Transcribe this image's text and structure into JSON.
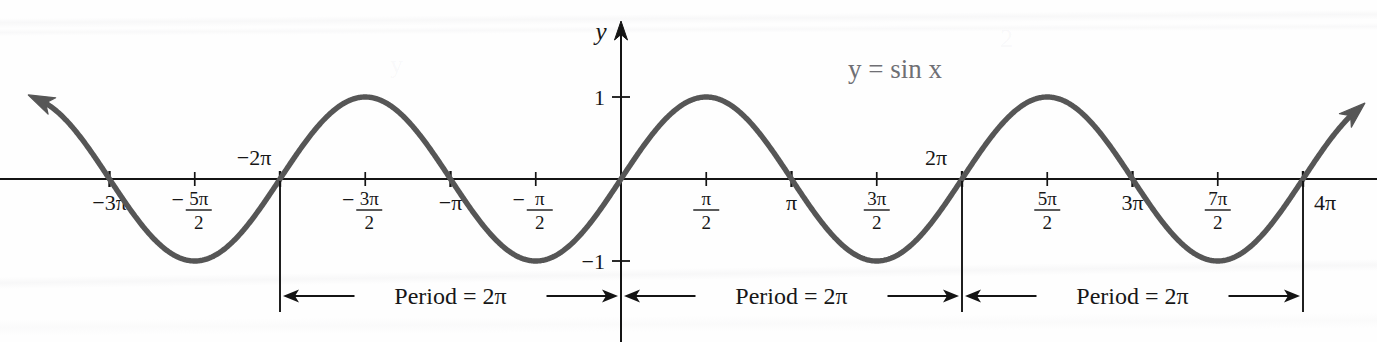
{
  "figure": {
    "curve_label": "y = sin x",
    "axis_labels": {
      "y": "y"
    },
    "colors": {
      "curve": "#565656",
      "axis": "#141414",
      "label": "#6f6f74",
      "background": "#fefefe"
    }
  },
  "chart_data": {
    "type": "line",
    "title": "y = sin x",
    "xlabel": "",
    "ylabel": "y",
    "xlim": [
      -3.4,
      4.3
    ],
    "ylim": [
      -1.35,
      1.35
    ],
    "grid": false,
    "legend": "none",
    "x_unit": "pi",
    "series": [
      {
        "name": "y = sin x",
        "expression": "sin(x)",
        "color": "#565656",
        "x_start_pi": -3.4,
        "x_end_pi": 4.3,
        "amplitude": 1,
        "period_pi": 2
      }
    ],
    "x_ticks": [
      {
        "value_pi": -3,
        "label": "−3π",
        "major": true,
        "type": "plain"
      },
      {
        "value_pi": -2.5,
        "label": "−5π/2",
        "major": false,
        "type": "fraction",
        "sign": "−",
        "num": "5π",
        "den": "2"
      },
      {
        "value_pi": -2,
        "label": "−2π",
        "major": true,
        "type": "plain"
      },
      {
        "value_pi": -1.5,
        "label": "−3π/2",
        "major": false,
        "type": "fraction",
        "sign": "−",
        "num": "3π",
        "den": "2"
      },
      {
        "value_pi": -1,
        "label": "−π",
        "major": true,
        "type": "plain"
      },
      {
        "value_pi": -0.5,
        "label": "−π/2",
        "major": false,
        "type": "fraction",
        "sign": "−",
        "num": "π",
        "den": "2"
      },
      {
        "value_pi": 0.5,
        "label": "π/2",
        "major": false,
        "type": "fraction",
        "sign": "",
        "num": "π",
        "den": "2"
      },
      {
        "value_pi": 1,
        "label": "π",
        "major": true,
        "type": "plain"
      },
      {
        "value_pi": 1.5,
        "label": "3π/2",
        "major": false,
        "type": "fraction",
        "sign": "",
        "num": "3π",
        "den": "2"
      },
      {
        "value_pi": 2,
        "label": "2π",
        "major": true,
        "type": "plain"
      },
      {
        "value_pi": 2.5,
        "label": "5π/2",
        "major": false,
        "type": "fraction",
        "sign": "",
        "num": "5π",
        "den": "2"
      },
      {
        "value_pi": 3,
        "label": "3π",
        "major": true,
        "type": "plain"
      },
      {
        "value_pi": 3.5,
        "label": "7π/2",
        "major": false,
        "type": "fraction",
        "sign": "",
        "num": "7π",
        "den": "2"
      },
      {
        "value_pi": 4,
        "label": "4π",
        "major": true,
        "type": "plain"
      }
    ],
    "y_ticks": [
      {
        "value": 1,
        "label": "1"
      },
      {
        "value": -1,
        "label": "−1"
      }
    ],
    "annotations": [
      {
        "name": "period-bracket-1",
        "text": "Period = 2π",
        "from_pi": -2,
        "to_pi": 0
      },
      {
        "name": "period-bracket-2",
        "text": "Period = 2π",
        "from_pi": 0,
        "to_pi": 2
      },
      {
        "name": "period-bracket-3",
        "text": "Period = 2π",
        "from_pi": 2,
        "to_pi": 4
      }
    ],
    "tick_labels_x": [
      "−3π",
      "−5π/2",
      "−2π",
      "−3π/2",
      "−π",
      "−π/2",
      "π/2",
      "π",
      "3π/2",
      "2π",
      "5π/2",
      "3π",
      "7π/2",
      "4π"
    ],
    "tick_labels_y": [
      "1",
      "−1"
    ],
    "key_points": {
      "maxima_pi": [
        -2.5,
        -0.5,
        1.5,
        3.5
      ],
      "minima_pi": [
        -1.5,
        0.5,
        2.5
      ],
      "zeros_pi": [
        -3,
        -2,
        -1,
        0,
        1,
        2,
        3,
        4
      ]
    },
    "ghost_labels": [
      "2π",
      "−2π",
      "π"
    ]
  },
  "geometry": {
    "origin_x": 621,
    "origin_y": 179,
    "pi_px": 170.5,
    "amplitude_px": 82,
    "period_row_y": 296,
    "drop_line_bottom": 312,
    "curve_label_x": 895,
    "curve_label_y": 78
  }
}
